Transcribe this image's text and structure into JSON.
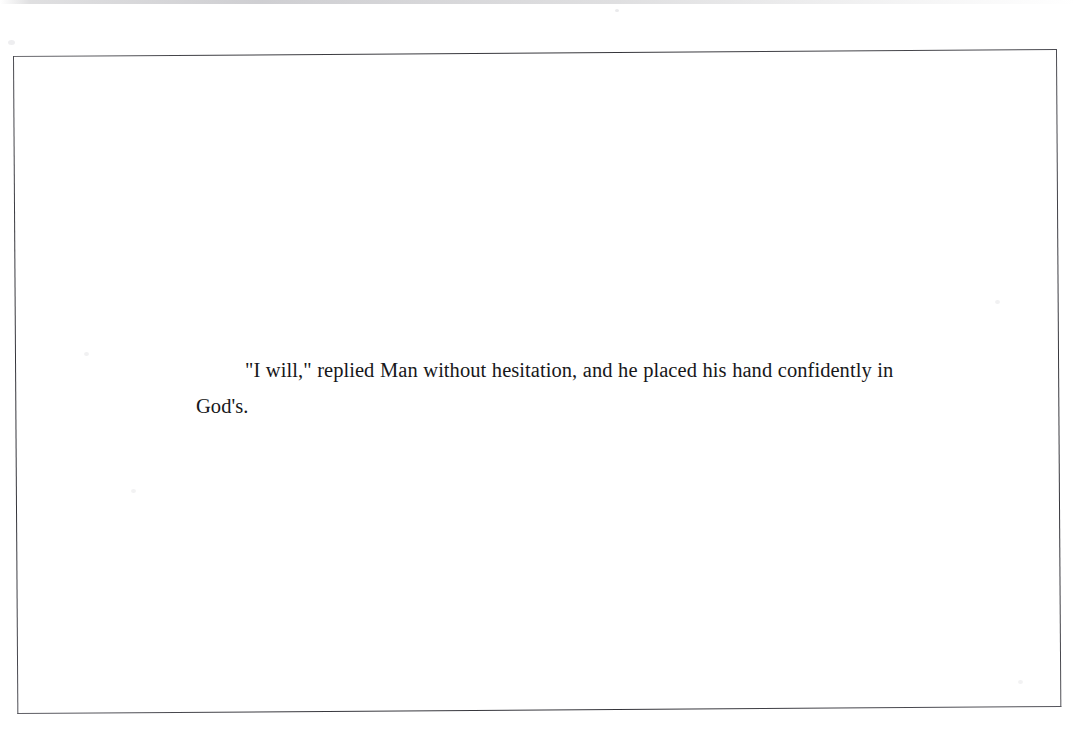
{
  "document": {
    "page_kind": "scanned-book-page",
    "orientation": "landscape",
    "border": {
      "style": "thin-rectangular-rule-frame",
      "color": "#3a3a40"
    },
    "body": {
      "paragraphs": [
        "\"I will,\" replied Man without hesitation, and he placed his hand confidently in God's."
      ]
    },
    "text_color": "#17171a",
    "background_color": "#ffffff"
  }
}
